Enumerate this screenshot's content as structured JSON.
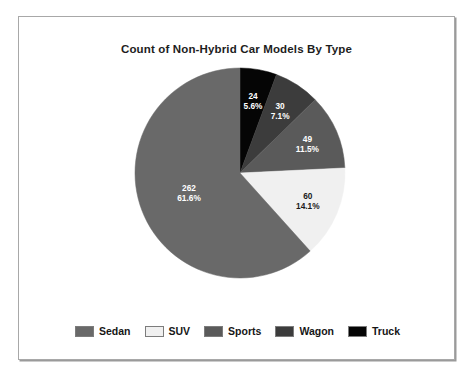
{
  "chart_data": {
    "type": "pie",
    "title": "Count of Non-Hybrid Car Models By Type",
    "xlabel": "",
    "ylabel": "",
    "total": 425,
    "legend_position": "bottom",
    "grid": false,
    "start_angle_deg": 0,
    "direction": "clockwise",
    "categories": [
      "Sedan",
      "SUV",
      "Sports",
      "Wagon",
      "Truck"
    ],
    "values": [
      262,
      60,
      49,
      30,
      24
    ],
    "percent_labels": [
      "61.6%",
      "14.1%",
      "11.5%",
      "7.1%",
      "5.6%"
    ],
    "percents": [
      61.6,
      14.1,
      11.5,
      7.1,
      5.6
    ],
    "colors": [
      "#696969",
      "#f0f0f0",
      "#5a5a5a",
      "#3c3c3c",
      "#050505"
    ],
    "label_colors": [
      "#ffffff",
      "#1a1a1a",
      "#ffffff",
      "#ffffff",
      "#ffffff"
    ],
    "slices": [
      {
        "name": "Truck",
        "value": 24,
        "percent_label": "5.6%",
        "color": "#050505",
        "label_color": "#ffffff"
      },
      {
        "name": "Wagon",
        "value": 30,
        "percent_label": "7.1%",
        "color": "#3c3c3c",
        "label_color": "#ffffff"
      },
      {
        "name": "Sports",
        "value": 49,
        "percent_label": "11.5%",
        "color": "#5a5a5a",
        "label_color": "#ffffff"
      },
      {
        "name": "SUV",
        "value": 60,
        "percent_label": "14.1%",
        "color": "#f0f0f0",
        "label_color": "#1a1a1a"
      },
      {
        "name": "Sedan",
        "value": 262,
        "percent_label": "61.6%",
        "color": "#696969",
        "label_color": "#ffffff"
      }
    ]
  },
  "legend": {
    "items": [
      {
        "label": "Sedan",
        "color": "#696969"
      },
      {
        "label": "SUV",
        "color": "#f0f0f0"
      },
      {
        "label": "Sports",
        "color": "#5a5a5a"
      },
      {
        "label": "Wagon",
        "color": "#3c3c3c"
      },
      {
        "label": "Truck",
        "color": "#050505"
      }
    ]
  }
}
